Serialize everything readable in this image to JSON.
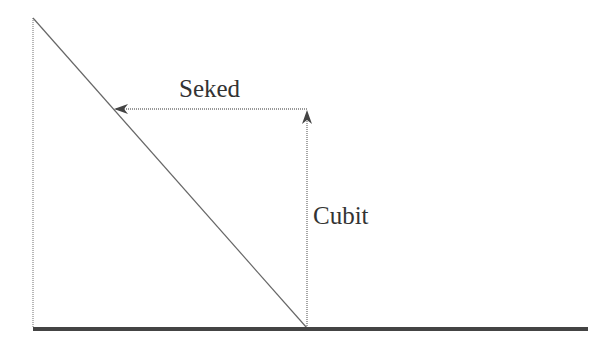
{
  "diagram": {
    "labels": {
      "horizontal": "Seked",
      "vertical": "Cubit"
    },
    "colors": {
      "line": "#555555",
      "baseline": "#444444",
      "text": "#333333"
    }
  }
}
